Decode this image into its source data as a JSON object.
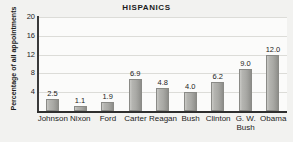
{
  "chart_data": {
    "type": "bar",
    "title": "HISPANICS",
    "xlabel": "",
    "ylabel": "Percentage of all appointments",
    "ylim": [
      0,
      20
    ],
    "yticks": [
      20,
      16,
      12,
      8,
      4
    ],
    "grid": true,
    "legend": false,
    "categories": [
      "Johnson",
      "Nixon",
      "Ford",
      "Carter",
      "Reagan",
      "Bush",
      "Clinton",
      "G. W.\nBush",
      "Obama"
    ],
    "values": [
      2.5,
      1.1,
      1.9,
      6.9,
      4.8,
      4.0,
      6.2,
      9.0,
      12.0
    ],
    "value_labels": [
      "2.5",
      "1.1",
      "1.9",
      "6.9",
      "4.8",
      "4.0",
      "6.2",
      "9.0",
      "12.0"
    ],
    "bar_color": "#aaaaa6",
    "background_color": "#f2f2f0",
    "plot_background_color": "#fbfbfa",
    "axis_color": "#2e2e2e",
    "gridline_color": "#dcdcd8",
    "text_color": "#1c1c1c"
  }
}
